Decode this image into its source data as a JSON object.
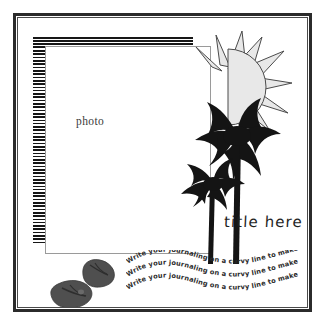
{
  "page": {
    "background_color": "#ffffff",
    "frame_color": "#2b2b2b",
    "inner_frame_color": "#4a4a4a"
  },
  "photo": {
    "label": "photo",
    "border_color": "#9a9a9a"
  },
  "title": {
    "text": "title here",
    "color": "#1f1f1f"
  },
  "journaling": {
    "lines": [
      "Write your journaling on a curvy line to make waves!",
      "Write your journaling on a curvy line to make waves!",
      "Write your journaling on a curvy line to make waves!"
    ],
    "color": "#2a2a2a"
  },
  "embellishments": {
    "sun": {
      "name": "sun-graphic",
      "fill_color": "#e8e8e8",
      "outline_color": "#4b4b4b",
      "ray_count": 9
    },
    "palm_trees": {
      "name": "palm-tree-graphic",
      "fill_color": "#141414",
      "count": 2
    },
    "flip_flops": {
      "name": "flip-flops-graphic",
      "fill_color": "#4d4d4d",
      "count": 2
    },
    "striped_border": {
      "name": "striped-border",
      "stripe_color": "#161616",
      "gap_color": "#ffffff"
    }
  }
}
